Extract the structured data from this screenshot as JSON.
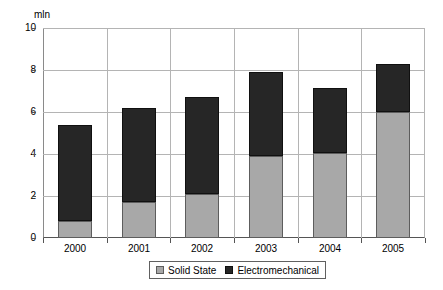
{
  "chart_data": {
    "type": "bar",
    "subtype": "stacked-vertical",
    "title": "",
    "xlabel": "",
    "ylabel": "mln",
    "units_label": "mln",
    "categories": [
      "2000",
      "2001",
      "2002",
      "2003",
      "2004",
      "2005"
    ],
    "series": [
      {
        "name": "Solid State",
        "color": "#a8a8a8",
        "values": [
          0.8,
          1.7,
          2.1,
          3.9,
          4.05,
          6.0
        ]
      },
      {
        "name": "Electromechanical",
        "color": "#262626",
        "values": [
          4.6,
          4.5,
          4.6,
          4.0,
          3.1,
          2.3
        ]
      }
    ],
    "totals": [
      5.4,
      6.2,
      6.7,
      7.9,
      7.15,
      8.3
    ],
    "ylim": [
      0,
      10
    ],
    "ytick_values": [
      0,
      2,
      4,
      6,
      8,
      10
    ],
    "ytick_labels": [
      "0",
      "2",
      "4",
      "6",
      "8",
      "10"
    ],
    "grid": {
      "horizontal": true,
      "vertical": true
    },
    "legend": {
      "position": "bottom-center",
      "entries": [
        "Solid State",
        "Electromechanical"
      ]
    }
  },
  "colors": {
    "solid_state": "#a8a8a8",
    "electromechanical": "#262626",
    "gridline": "#b4b4b4",
    "axis": "#555555",
    "text": "#000000",
    "background": "#ffffff"
  }
}
